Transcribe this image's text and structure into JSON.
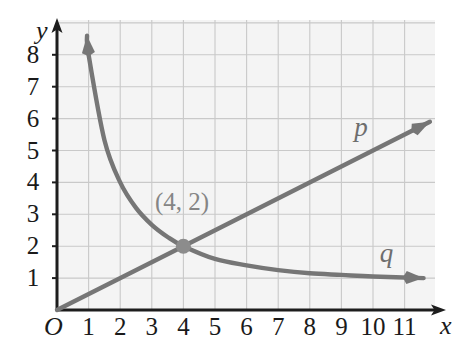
{
  "figure": {
    "background_color": "#ffffff",
    "plot_background_color": "#f4f4f4",
    "grid_line_color": "#c9c9c9",
    "axis_color": "#1d1d1d",
    "curve_color": "#767676",
    "point_color": "#8c8c8c",
    "label_color": "#1a1a1a"
  },
  "chart_data": {
    "type": "line",
    "title": "",
    "xlabel": "x",
    "ylabel": "y",
    "xlim": [
      0,
      11.8
    ],
    "ylim": [
      0,
      8.8
    ],
    "grid": true,
    "legend": "inline-curve-labels",
    "origin_label": "O",
    "x_ticks": [
      1,
      2,
      3,
      4,
      5,
      6,
      7,
      8,
      9,
      10,
      11
    ],
    "x_tick_labels": [
      "1",
      "2",
      "3",
      "4",
      "5",
      "6",
      "7",
      "8",
      "9",
      "10",
      "11"
    ],
    "y_ticks": [
      1,
      2,
      3,
      4,
      5,
      6,
      7,
      8
    ],
    "y_tick_labels": [
      "1",
      "2",
      "3",
      "4",
      "5",
      "6",
      "7",
      "8"
    ],
    "series": [
      {
        "name": "p",
        "label": "p",
        "kind": "line",
        "equation": "y = 0.5x",
        "arrow_end": true,
        "points": [
          {
            "x": 0,
            "y": 0
          },
          {
            "x": 4,
            "y": 2
          },
          {
            "x": 11.8,
            "y": 5.9
          }
        ]
      },
      {
        "name": "q",
        "label": "q",
        "kind": "curve",
        "equation": "y = 8/x",
        "arrow_start": true,
        "arrow_end": true,
        "points": [
          {
            "x": 0.95,
            "y": 8.6
          },
          {
            "x": 1,
            "y": 8
          },
          {
            "x": 1.5,
            "y": 5.33
          },
          {
            "x": 2,
            "y": 4
          },
          {
            "x": 2.5,
            "y": 3.2
          },
          {
            "x": 3,
            "y": 2.67
          },
          {
            "x": 3.5,
            "y": 2.29
          },
          {
            "x": 4,
            "y": 2
          },
          {
            "x": 5,
            "y": 1.6
          },
          {
            "x": 6,
            "y": 1.4
          },
          {
            "x": 7,
            "y": 1.25
          },
          {
            "x": 8,
            "y": 1.15
          },
          {
            "x": 9,
            "y": 1.1
          },
          {
            "x": 10,
            "y": 1.05
          },
          {
            "x": 11.6,
            "y": 1.0
          }
        ]
      }
    ],
    "annotations": [
      {
        "name": "intersection-point",
        "text": "(4, 2)",
        "x": 4,
        "y": 2,
        "marker": "filled-circle"
      }
    ],
    "curve_labels": [
      {
        "name": "p",
        "text": "p",
        "x": 9.6,
        "y": 5.7
      },
      {
        "name": "q",
        "text": "q",
        "x": 10.4,
        "y": 1.75
      }
    ]
  }
}
